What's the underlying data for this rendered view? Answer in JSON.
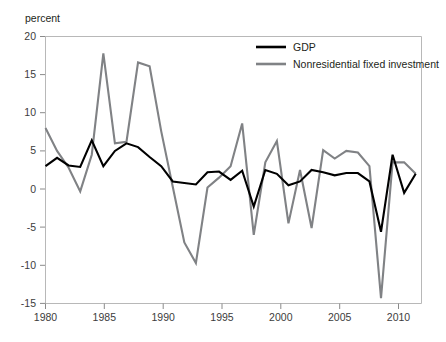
{
  "chart_data": {
    "type": "line",
    "title": "",
    "subtitle": "",
    "ylabel": "percent",
    "xlabel": "",
    "ylim": [
      -15,
      20
    ],
    "xlim": [
      1980,
      2012.5
    ],
    "yticks": [
      "20",
      "15",
      "10",
      "5",
      "0",
      "-5",
      "-10",
      "-15"
    ],
    "ytick_values": [
      20,
      15,
      10,
      5,
      0,
      -5,
      -10,
      -15
    ],
    "xticks": [
      "1980",
      "1985",
      "1990",
      "1995",
      "2000",
      "2005",
      "2010"
    ],
    "xtick_values": [
      1980,
      1985,
      1990,
      1995,
      2000,
      2005,
      2010
    ],
    "grid": false,
    "legend_position": "top-right",
    "x": [
      1980,
      1981,
      1982,
      1983,
      1984,
      1985,
      1986,
      1987,
      1988,
      1989,
      1990,
      1991,
      1992,
      1993,
      1994,
      1995,
      1996,
      1997,
      1998,
      1999,
      2000,
      2001,
      2002,
      2003,
      2004,
      2005,
      2006,
      2007,
      2008,
      2009,
      2010,
      2011,
      2012
    ],
    "series": [
      {
        "name": "GDP",
        "color": "#000000",
        "values": [
          3.0,
          4.1,
          3.1,
          2.9,
          6.4,
          3.0,
          5.0,
          6.0,
          5.5,
          4.2,
          3.0,
          1.0,
          0.8,
          0.6,
          2.2,
          2.3,
          1.2,
          2.4,
          -2.3,
          2.5,
          2.0,
          0.5,
          1.0,
          2.5,
          2.2,
          1.8,
          2.1,
          2.1,
          1.0,
          -5.6,
          4.5,
          -0.5,
          2.0
        ]
      },
      {
        "name": "Nonresidential fixed investment",
        "color": "#808285",
        "values": [
          8.0,
          5.0,
          2.8,
          -0.3,
          4.5,
          17.8,
          6.0,
          6.2,
          16.6,
          16.1,
          7.6,
          0.3,
          -7.0,
          -9.7,
          0.2,
          1.5,
          3.0,
          8.6,
          -6.0,
          3.5,
          6.3,
          -4.5,
          2.5,
          -5.1,
          5.1,
          4.0,
          5.0,
          4.8,
          3.0,
          -14.3,
          3.5,
          3.5,
          2.0
        ]
      }
    ],
    "legend": [
      {
        "label": "GDP",
        "color": "#000000"
      },
      {
        "label": "Nonresidential fixed investment",
        "color": "#808285"
      }
    ],
    "colors": {
      "gdp": "#000000",
      "nonresidential_fixed_investment": "#808285",
      "frame": "#b8b8b8",
      "text": "#231f20",
      "background": "#ffffff"
    }
  }
}
